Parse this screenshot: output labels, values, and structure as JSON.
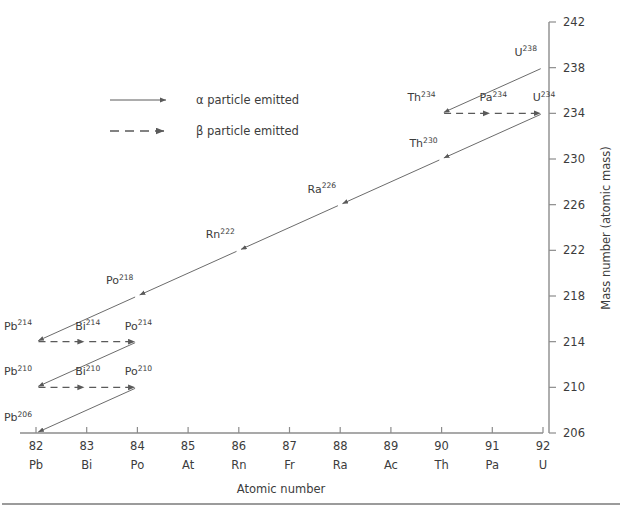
{
  "chart_data": {
    "type": "scatter",
    "title": "",
    "xlabel": "Atomic number",
    "ylabel": "Mass number (atomic mass)",
    "xlim": [
      81.5,
      92.7
    ],
    "ylim": [
      206,
      242
    ],
    "grid": false,
    "legend_position": "upper-left",
    "x_ticks": [
      82,
      83,
      84,
      85,
      86,
      87,
      88,
      89,
      90,
      91,
      92
    ],
    "x_tick_labels": [
      "82",
      "83",
      "84",
      "85",
      "86",
      "87",
      "88",
      "89",
      "90",
      "91",
      "92"
    ],
    "x_tick_symbols": [
      "Pb",
      "Bi",
      "Po",
      "At",
      "Rn",
      "Fr",
      "Ra",
      "Ac",
      "Th",
      "Pa",
      "U"
    ],
    "y_ticks": [
      206,
      210,
      214,
      218,
      222,
      226,
      230,
      234,
      238,
      242
    ],
    "y_tick_labels": [
      "206",
      "210",
      "214",
      "218",
      "222",
      "226",
      "230",
      "234",
      "238",
      "242"
    ],
    "legend": [
      {
        "key": "alpha",
        "label": "α particle emitted",
        "style": "solid-arrow"
      },
      {
        "key": "beta",
        "label": "β particle emitted",
        "style": "dashed-arrow"
      }
    ],
    "nuclides": [
      {
        "id": "U238",
        "element": "U",
        "mass": "238",
        "z": 92,
        "a": 238
      },
      {
        "id": "Th234",
        "element": "Th",
        "mass": "234",
        "z": 90,
        "a": 234
      },
      {
        "id": "Pa234",
        "element": "Pa",
        "mass": "234",
        "z": 91,
        "a": 234
      },
      {
        "id": "U234",
        "element": "U",
        "mass": "234",
        "z": 92,
        "a": 234
      },
      {
        "id": "Th230",
        "element": "Th",
        "mass": "230",
        "z": 90,
        "a": 230
      },
      {
        "id": "Ra226",
        "element": "Ra",
        "mass": "226",
        "z": 88,
        "a": 226
      },
      {
        "id": "Rn222",
        "element": "Rn",
        "mass": "222",
        "z": 86,
        "a": 222
      },
      {
        "id": "Po218",
        "element": "Po",
        "mass": "218",
        "z": 84,
        "a": 218
      },
      {
        "id": "Pb214",
        "element": "Pb",
        "mass": "214",
        "z": 82,
        "a": 214
      },
      {
        "id": "Bi214",
        "element": "Bi",
        "mass": "214",
        "z": 83,
        "a": 214
      },
      {
        "id": "Po214",
        "element": "Po",
        "mass": "214",
        "z": 84,
        "a": 214
      },
      {
        "id": "Pb210",
        "element": "Pb",
        "mass": "210",
        "z": 82,
        "a": 210
      },
      {
        "id": "Bi210",
        "element": "Bi",
        "mass": "210",
        "z": 83,
        "a": 210
      },
      {
        "id": "Po210",
        "element": "Po",
        "mass": "210",
        "z": 84,
        "a": 210
      },
      {
        "id": "Pb206",
        "element": "Pb",
        "mass": "206",
        "z": 82,
        "a": 206
      }
    ],
    "decays": [
      {
        "from": "U238",
        "to": "Th234",
        "type": "alpha"
      },
      {
        "from": "Th234",
        "to": "Pa234",
        "type": "beta"
      },
      {
        "from": "Pa234",
        "to": "U234",
        "type": "beta"
      },
      {
        "from": "U234",
        "to": "Th230",
        "type": "alpha"
      },
      {
        "from": "Th230",
        "to": "Ra226",
        "type": "alpha"
      },
      {
        "from": "Ra226",
        "to": "Rn222",
        "type": "alpha"
      },
      {
        "from": "Rn222",
        "to": "Po218",
        "type": "alpha"
      },
      {
        "from": "Po218",
        "to": "Pb214",
        "type": "alpha"
      },
      {
        "from": "Pb214",
        "to": "Bi214",
        "type": "beta"
      },
      {
        "from": "Bi214",
        "to": "Po214",
        "type": "beta"
      },
      {
        "from": "Po214",
        "to": "Pb210",
        "type": "alpha"
      },
      {
        "from": "Pb210",
        "to": "Bi210",
        "type": "beta"
      },
      {
        "from": "Bi210",
        "to": "Po210",
        "type": "beta"
      },
      {
        "from": "Po210",
        "to": "Pb206",
        "type": "alpha"
      }
    ]
  },
  "colors": {
    "axis": "#8c8c8c",
    "arrow": "#5a5a5a",
    "text": "#3c3c3c",
    "background": "#ffffff",
    "rule": "#7a7a7a"
  }
}
